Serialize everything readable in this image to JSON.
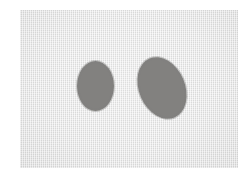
{
  "image": {
    "title": "Two gray elliptical blobs on a light gray rectangular field",
    "width": 249,
    "height": 179,
    "background_color": "#ffffff",
    "description": "A scanned-looking light gray rectangle occupying most of the frame, containing two medium-gray filled shapes: a round circle on the left and a larger oval tilted counter-clockwise on the right."
  },
  "plate": {
    "name": "gray-field",
    "color": "#e6e6e6",
    "left": 20,
    "top": 10,
    "width": 218,
    "height": 158,
    "texture": "fine paper grain"
  },
  "shapes": [
    {
      "name": "left-circle",
      "kind": "circle",
      "fill_color": "#82817f",
      "left": 77,
      "top": 61,
      "width": 37,
      "height": 50,
      "center_x": 95,
      "center_y": 86,
      "rotation_deg": 0
    },
    {
      "name": "right-oval",
      "kind": "ellipse",
      "fill_color": "#82817f",
      "left": 139,
      "top": 56,
      "width": 46,
      "height": 64,
      "center_x": 162,
      "center_y": 88,
      "rotation_deg": -23
    }
  ]
}
